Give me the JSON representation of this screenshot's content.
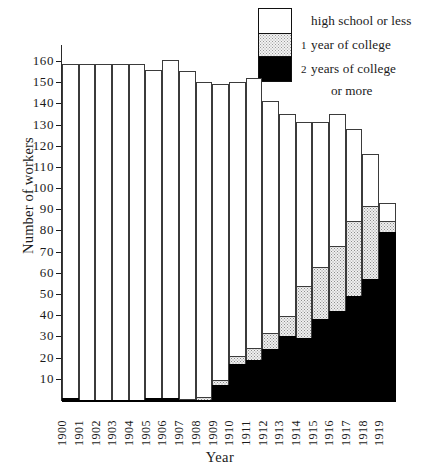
{
  "chart_data": {
    "type": "bar",
    "stacked": true,
    "title": "",
    "xlabel": "Year",
    "ylabel": "Number of workers",
    "ylim": [
      0,
      168
    ],
    "ytick_values": [
      10,
      20,
      30,
      40,
      50,
      60,
      70,
      80,
      90,
      100,
      110,
      120,
      130,
      140,
      150,
      160
    ],
    "ytick_labels": [
      "10",
      "20",
      "30",
      "40",
      "50",
      "60",
      "70",
      "80",
      "90",
      "100",
      "110",
      "120",
      "130",
      "140",
      "150",
      "160"
    ],
    "grid": false,
    "legend_position": "top-right",
    "categories": [
      "1900",
      "1901",
      "1902",
      "1903",
      "1904",
      "1905",
      "1906",
      "1907",
      "1908",
      "1909",
      "1910",
      "1911",
      "1912",
      "1913",
      "1914",
      "1915",
      "1916",
      "1917",
      "1918",
      "1919"
    ],
    "series": [
      {
        "name": "high school or less",
        "color": "#ffffff",
        "values": [
          158,
          159,
          159,
          159,
          159,
          155,
          160,
          155,
          149,
          140,
          130,
          128,
          110,
          96,
          78,
          69,
          63,
          44,
          25,
          9
        ]
      },
      {
        "name": "1 year of college",
        "color": "#efefef",
        "values": [
          0,
          0,
          0,
          0,
          0,
          0,
          0,
          1,
          2,
          3,
          4,
          6,
          8,
          10,
          25,
          25,
          31,
          36,
          35,
          6
        ]
      },
      {
        "name": "2 years of college or more",
        "color": "#000000",
        "values": [
          2,
          1,
          1,
          1,
          1,
          2,
          2,
          1,
          1,
          8,
          18,
          20,
          25,
          31,
          30,
          39,
          43,
          50,
          58,
          80
        ]
      }
    ],
    "totals": [
      160,
      160,
      160,
      160,
      160,
      157,
      162,
      157,
      152,
      151,
      152,
      154,
      143,
      137,
      133,
      133,
      137,
      130,
      118,
      95
    ]
  },
  "legend": {
    "entries": [
      {
        "prefix": "",
        "label": "high school or less",
        "swatch": "white"
      },
      {
        "prefix": "1",
        "label": "year of college",
        "swatch": "dotted"
      },
      {
        "prefix": "2",
        "label": "years of college",
        "swatch": "black"
      }
    ],
    "continuation": "or more"
  },
  "axes": {
    "y_title": "Number of workers",
    "x_title": "Year"
  }
}
